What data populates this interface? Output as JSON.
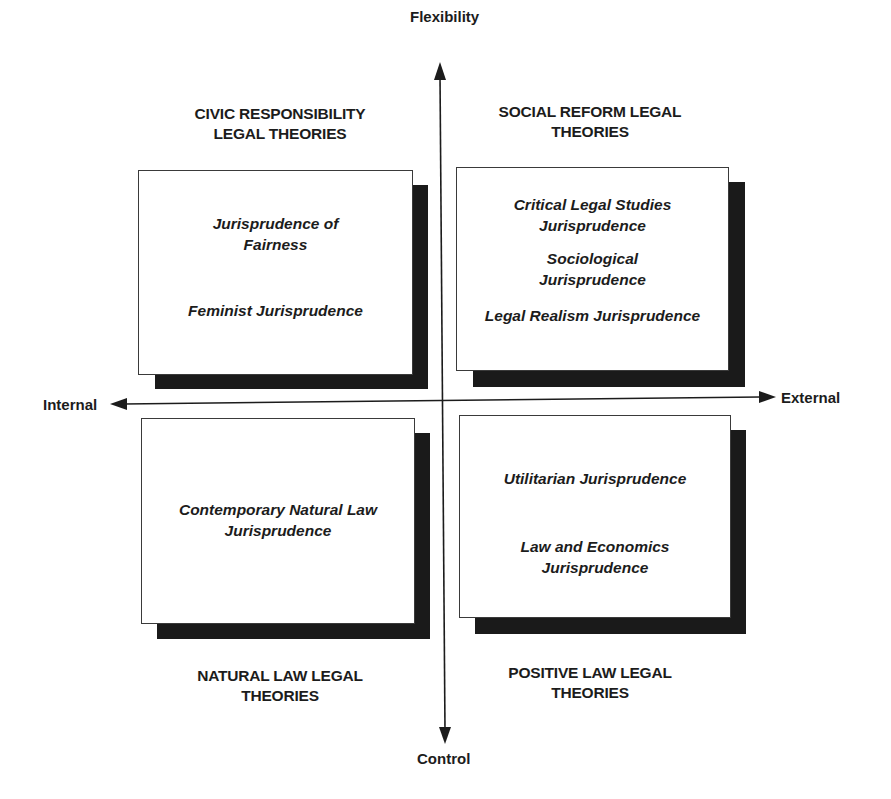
{
  "axes": {
    "top": "Flexibility",
    "bottom": "Control",
    "left": "Internal",
    "right": "External"
  },
  "quadrants": {
    "top_left": {
      "title": [
        "CIVIC RESPONSIBILITY",
        "LEGAL THEORIES"
      ],
      "items": [
        [
          "Jurisprudence of",
          "Fairness"
        ],
        [
          "Feminist Jurisprudence"
        ]
      ]
    },
    "top_right": {
      "title": [
        "SOCIAL REFORM LEGAL",
        "THEORIES"
      ],
      "items": [
        [
          "Critical Legal Studies",
          "Jurisprudence"
        ],
        [
          "Sociological",
          "Jurisprudence"
        ],
        [
          "Legal Realism Jurisprudence"
        ]
      ]
    },
    "bottom_left": {
      "title": [
        "NATURAL LAW LEGAL",
        "THEORIES"
      ],
      "items": [
        [
          "Contemporary Natural Law",
          "Jurisprudence"
        ]
      ]
    },
    "bottom_right": {
      "title": [
        "POSITIVE LAW LEGAL",
        "THEORIES"
      ],
      "items": [
        [
          "Utilitarian Jurisprudence"
        ],
        [
          "Law and Economics",
          "Jurisprudence"
        ]
      ]
    }
  },
  "colors": {
    "line": "#1c1c1c",
    "shadow": "#1a1a1a",
    "box_fill": "#ffffff"
  }
}
